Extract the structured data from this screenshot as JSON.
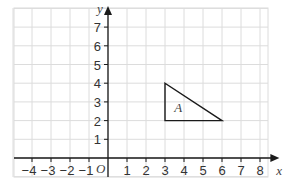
{
  "diagram": {
    "type": "coordinate-grid",
    "x_axis": {
      "label": "x",
      "ticks": [
        "−4",
        "−3",
        "−2",
        "−1",
        "1",
        "2",
        "3",
        "4",
        "5",
        "6",
        "7",
        "8"
      ],
      "range": [
        -5,
        8.6
      ]
    },
    "y_axis": {
      "label": "y",
      "ticks": [
        "1",
        "2",
        "3",
        "4",
        "5",
        "6",
        "7"
      ],
      "range": [
        -1,
        7.6
      ]
    },
    "origin_label": "O",
    "shape": {
      "label": "A",
      "vertices": [
        [
          3,
          4
        ],
        [
          3,
          2
        ],
        [
          6,
          2
        ]
      ],
      "stroke": "#1a1a1a"
    },
    "colors": {
      "grid": "#dcdcdc",
      "axis": "#1a1a1a"
    }
  }
}
